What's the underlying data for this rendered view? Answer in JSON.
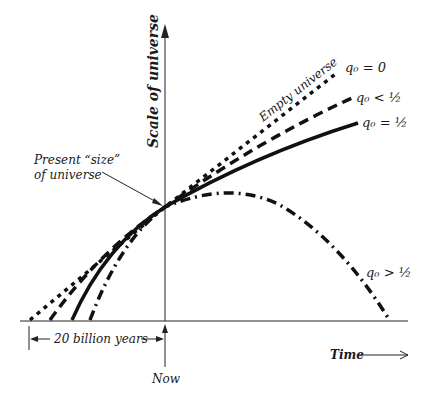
{
  "diagram": {
    "y_axis_label": "Scale of universe",
    "x_axis_label": "Time",
    "now_label": "Now",
    "span_label": "20 billion years",
    "present_label_line1": "Present “size”",
    "present_label_line2": "of universe",
    "curves": [
      {
        "name": "empty-universe",
        "label": "q₀ = 0",
        "annotation": "Empty universe",
        "style": "dotted"
      },
      {
        "name": "q0-less-half",
        "label": "q₀ < ½",
        "style": "dashed"
      },
      {
        "name": "q0-equal-half",
        "label": "q₀ = ½",
        "style": "solid"
      },
      {
        "name": "q0-greater-half",
        "label": "q₀ > ½",
        "style": "dash-dot"
      }
    ],
    "colors": {
      "ink": "#111111",
      "background": "#ffffff"
    }
  }
}
